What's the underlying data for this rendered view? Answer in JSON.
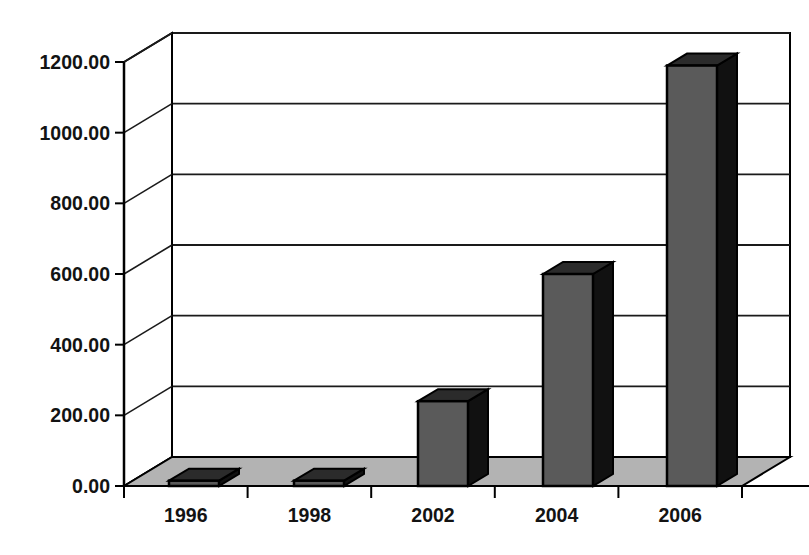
{
  "chart_data": {
    "type": "bar",
    "render_style": "3d-column-scanned",
    "title": "",
    "subtitle": "",
    "xlabel": "",
    "ylabel": "",
    "categories": [
      "1996",
      "1998",
      "2002",
      "2004",
      "2006"
    ],
    "values": [
      15,
      15,
      240,
      600,
      1190
    ],
    "series": [
      {
        "name": "",
        "values": [
          15,
          15,
          240,
          600,
          1190
        ]
      }
    ],
    "ylim": [
      0,
      1200
    ],
    "ytick_values": [
      0,
      200,
      400,
      600,
      800,
      1000,
      1200
    ],
    "ytick_labels": [
      "0.00",
      "200.00",
      "400.00",
      "600.00",
      "800.00",
      "1000.00",
      "1200.00"
    ],
    "xtick_labels": [
      "1996",
      "1998",
      "2002",
      "2004",
      "2006"
    ],
    "grid": true,
    "grid_axis": "y",
    "legend": false,
    "legend_position": "none",
    "annotations": [],
    "colors": {
      "bar_front": "#5a5a5a",
      "bar_side": "#111111",
      "bar_top": "#2b2b2b",
      "bar_outline": "#000000",
      "floor": "#b3b3b3",
      "floor_outline": "#000000",
      "wall": "#ffffff",
      "gridline": "#1a1a1a",
      "axis": "#000000",
      "text": "#131313",
      "background": "#ffffff"
    }
  },
  "geometry": {
    "front_left_x": 124,
    "front_right_x": 742,
    "baseline_y": 486,
    "top_y": 62,
    "depth_dx": 48,
    "depth_dy": -29,
    "bar_width": 50,
    "bar_centers_x": [
      194,
      319,
      443,
      568,
      692
    ]
  }
}
